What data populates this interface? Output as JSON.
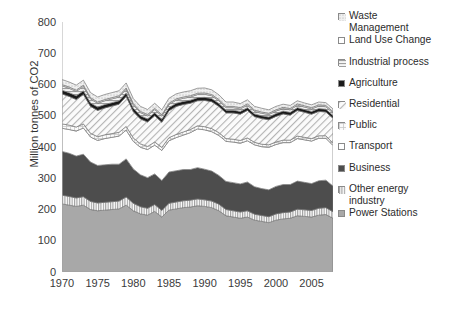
{
  "chart_data": {
    "type": "area",
    "title": "",
    "xlabel": "",
    "ylabel": "Million tonnes of CO2",
    "ylim": [
      0,
      800
    ],
    "ytick_values": [
      800,
      700,
      600,
      500,
      400,
      300,
      200,
      100,
      0
    ],
    "xtick_values": [
      1970,
      1975,
      1980,
      1985,
      1990,
      1995,
      2000,
      2005
    ],
    "xlim": [
      1970,
      2008
    ],
    "grid": false,
    "stacked": true,
    "legend_position": "right",
    "x": [
      1970,
      1971,
      1972,
      1973,
      1974,
      1975,
      1976,
      1977,
      1978,
      1979,
      1980,
      1981,
      1982,
      1983,
      1984,
      1985,
      1986,
      1987,
      1988,
      1989,
      1990,
      1991,
      1992,
      1993,
      1994,
      1995,
      1996,
      1997,
      1998,
      1999,
      2000,
      2001,
      2002,
      2003,
      2004,
      2005,
      2006,
      2007,
      2008
    ],
    "series": [
      {
        "name": "Power Stations",
        "swatch": "#a8a8a8",
        "pattern": "solid-gray",
        "values": [
          218,
          214,
          210,
          214,
          200,
          196,
          198,
          200,
          202,
          214,
          196,
          186,
          182,
          194,
          176,
          198,
          202,
          206,
          208,
          212,
          210,
          206,
          196,
          180,
          176,
          172,
          176,
          166,
          162,
          158,
          166,
          170,
          172,
          180,
          178,
          176,
          182,
          184,
          172
        ]
      },
      {
        "name": "Other energy industry",
        "swatch": "#d8d8d8",
        "pattern": "vertical-stripes",
        "values": [
          28,
          28,
          27,
          27,
          26,
          25,
          25,
          25,
          25,
          26,
          24,
          23,
          22,
          22,
          21,
          22,
          22,
          22,
          22,
          22,
          21,
          21,
          21,
          20,
          20,
          20,
          20,
          19,
          19,
          19,
          20,
          20,
          20,
          21,
          21,
          21,
          22,
          22,
          21
        ]
      },
      {
        "name": "Business",
        "swatch": "#4d4d4d",
        "pattern": "solid-dark",
        "values": [
          140,
          138,
          134,
          136,
          126,
          120,
          120,
          120,
          118,
          122,
          110,
          102,
          98,
          98,
          96,
          100,
          100,
          100,
          98,
          100,
          98,
          96,
          92,
          90,
          90,
          90,
          92,
          88,
          86,
          86,
          88,
          90,
          88,
          90,
          88,
          86,
          88,
          88,
          82
        ]
      },
      {
        "name": "Transport",
        "swatch": "#ffffff",
        "pattern": "white",
        "values": [
          74,
          76,
          80,
          84,
          80,
          80,
          84,
          86,
          90,
          92,
          88,
          88,
          90,
          92,
          96,
          100,
          106,
          110,
          118,
          124,
          126,
          126,
          128,
          128,
          130,
          130,
          132,
          134,
          134,
          136,
          134,
          134,
          134,
          136,
          136,
          136,
          136,
          134,
          130
        ]
      },
      {
        "name": "Public",
        "swatch": "#e0e0e0",
        "pattern": "light-grid",
        "values": [
          14,
          14,
          13,
          13,
          12,
          12,
          12,
          12,
          12,
          12,
          11,
          11,
          10,
          10,
          10,
          10,
          10,
          10,
          10,
          10,
          10,
          10,
          9,
          9,
          9,
          9,
          9,
          8,
          8,
          8,
          8,
          8,
          8,
          8,
          8,
          8,
          8,
          8,
          7
        ]
      },
      {
        "name": "Residential",
        "swatch": "#f2f2f2",
        "pattern": "diagonal-hatch",
        "values": [
          96,
          92,
          88,
          94,
          86,
          84,
          86,
          88,
          90,
          96,
          84,
          80,
          78,
          84,
          80,
          86,
          90,
          88,
          84,
          80,
          84,
          86,
          84,
          82,
          84,
          84,
          88,
          82,
          82,
          80,
          82,
          84,
          80,
          82,
          80,
          78,
          78,
          76,
          80
        ]
      },
      {
        "name": "Agriculture",
        "swatch": "#1a1a1a",
        "pattern": "solid-black",
        "values": [
          12,
          12,
          12,
          12,
          11,
          11,
          11,
          11,
          11,
          11,
          11,
          10,
          10,
          10,
          10,
          10,
          10,
          10,
          10,
          10,
          10,
          10,
          9,
          9,
          9,
          9,
          9,
          9,
          9,
          9,
          9,
          9,
          9,
          9,
          9,
          9,
          9,
          9,
          9
        ]
      },
      {
        "name": "Industrial process",
        "swatch": "#cccccc",
        "pattern": "horizontal-lines",
        "values": [
          14,
          14,
          14,
          14,
          13,
          12,
          12,
          12,
          12,
          12,
          11,
          10,
          10,
          10,
          10,
          10,
          10,
          10,
          10,
          10,
          10,
          9,
          9,
          8,
          8,
          8,
          8,
          8,
          8,
          8,
          8,
          8,
          8,
          8,
          8,
          8,
          8,
          8,
          8
        ]
      },
      {
        "name": "Land Use Change",
        "swatch": "#ffffff",
        "pattern": "white",
        "values": [
          4,
          4,
          4,
          4,
          4,
          4,
          4,
          4,
          4,
          4,
          4,
          4,
          4,
          4,
          4,
          4,
          4,
          4,
          4,
          4,
          4,
          4,
          4,
          4,
          4,
          4,
          4,
          4,
          4,
          4,
          4,
          4,
          4,
          4,
          4,
          4,
          4,
          4,
          4
        ]
      },
      {
        "name": "Waste Management",
        "swatch": "#e8e8e8",
        "pattern": "fine-dots",
        "values": [
          16,
          16,
          16,
          16,
          16,
          16,
          16,
          16,
          16,
          16,
          16,
          16,
          16,
          16,
          16,
          16,
          16,
          16,
          16,
          16,
          16,
          15,
          15,
          14,
          14,
          13,
          13,
          12,
          12,
          11,
          11,
          10,
          10,
          10,
          9,
          9,
          9,
          9,
          9
        ]
      }
    ],
    "legend_entries": [
      {
        "label": "Waste\nManagement",
        "swatch": "#e8e8e8",
        "pattern": "fine-dots"
      },
      {
        "label": "Land Use Change",
        "swatch": "#ffffff",
        "pattern": "white"
      },
      {
        "label": "Industrial process",
        "swatch": "#cccccc",
        "pattern": "horizontal-lines"
      },
      {
        "label": "Agriculture",
        "swatch": "#1a1a1a",
        "pattern": "solid-black"
      },
      {
        "label": "Residential",
        "swatch": "#f2f2f2",
        "pattern": "diagonal-hatch"
      },
      {
        "label": "Public",
        "swatch": "#e0e0e0",
        "pattern": "light-grid"
      },
      {
        "label": "Transport",
        "swatch": "#ffffff",
        "pattern": "white"
      },
      {
        "label": "Business",
        "swatch": "#4d4d4d",
        "pattern": "solid-dark"
      },
      {
        "label": "Other energy\nindustry",
        "swatch": "#d8d8d8",
        "pattern": "vertical-stripes"
      },
      {
        "label": "Power Stations",
        "swatch": "#a8a8a8",
        "pattern": "solid-gray"
      }
    ]
  }
}
